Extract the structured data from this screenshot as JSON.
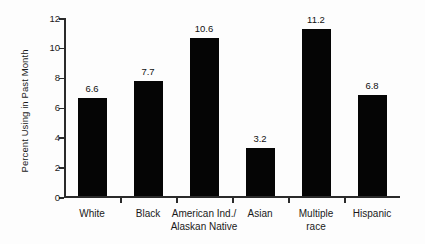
{
  "chart_data": {
    "type": "bar",
    "title": "",
    "subtitle": "",
    "xlabel": "",
    "ylabel": "Percent Using in Past Month",
    "categories": [
      "White",
      "Black",
      "American Ind./\nAlaskan Native",
      "Asian",
      "Multiple\nrace",
      "Hispanic"
    ],
    "values": [
      6.6,
      7.7,
      10.6,
      3.2,
      11.2,
      6.8
    ],
    "value_labels": [
      "6.6",
      "7.7",
      "10.6",
      "3.2",
      "11.2",
      "6.8"
    ],
    "ylim": [
      0,
      12
    ],
    "yticks": [
      0,
      2,
      4,
      6,
      8,
      10,
      12
    ],
    "ytick_labels": [
      "0",
      "2",
      "4",
      "6",
      "8",
      "10",
      "12"
    ],
    "grid": false,
    "legend": null,
    "bar_color": "#050505",
    "axis_color": "#2b2b2b",
    "background_color": "#fdfdfd"
  }
}
